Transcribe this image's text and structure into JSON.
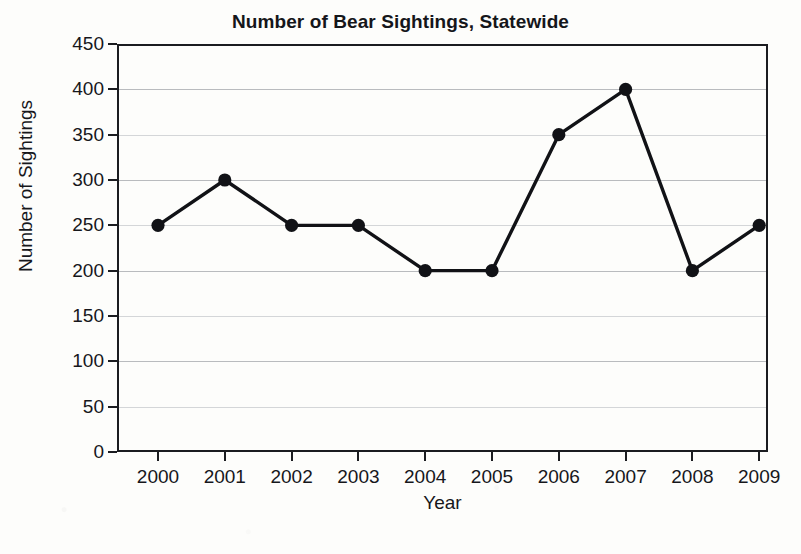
{
  "chart_data": {
    "type": "line",
    "title": "Number of Bear Sightings, Statewide",
    "xlabel": "Year",
    "ylabel": "Number of Sightings",
    "categories": [
      "2000",
      "2001",
      "2002",
      "2003",
      "2004",
      "2005",
      "2006",
      "2007",
      "2008",
      "2009"
    ],
    "values": [
      250,
      300,
      250,
      250,
      200,
      200,
      350,
      400,
      200,
      250
    ],
    "yticks": [
      0,
      50,
      100,
      150,
      200,
      250,
      300,
      350,
      400,
      450
    ],
    "ytick_labels": [
      "0",
      "50",
      "100",
      "150",
      "200",
      "250",
      "300",
      "350",
      "400",
      "450"
    ],
    "ylim": [
      0,
      450
    ],
    "grid": true,
    "grid_axis": "y",
    "legend": "none",
    "marker": "filled-circle",
    "line_color": "#111216",
    "marker_color": "#111216",
    "grid_color": "#b9bbbe",
    "background_color": "#fdfdfb"
  }
}
